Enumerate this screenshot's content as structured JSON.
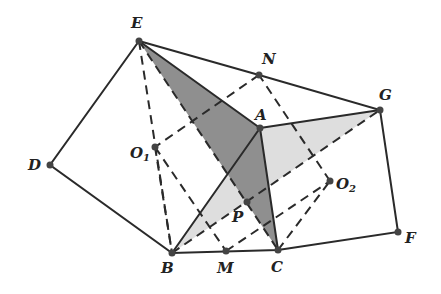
{
  "diagram": {
    "type": "geometry",
    "colors": {
      "dark_fill": "#8c8c8c",
      "light_fill": "#dcdcdc",
      "line": "#2a2a2a"
    },
    "points": {
      "E": {
        "label": "E",
        "x": 139,
        "y": 41
      },
      "N": {
        "label": "N",
        "x": 259,
        "y": 75
      },
      "G": {
        "label": "G",
        "x": 380,
        "y": 110
      },
      "A": {
        "label": "A",
        "x": 260,
        "y": 128
      },
      "O1": {
        "label": "O",
        "sub": "1",
        "x": 155,
        "y": 147
      },
      "D": {
        "label": "D",
        "x": 50,
        "y": 165
      },
      "O2": {
        "label": "O",
        "sub": "2",
        "x": 330,
        "y": 181
      },
      "P": {
        "label": "P",
        "x": 247,
        "y": 202
      },
      "B": {
        "label": "B",
        "x": 172,
        "y": 253
      },
      "M": {
        "label": "M",
        "x": 226,
        "y": 251
      },
      "C": {
        "label": "C",
        "x": 278,
        "y": 250
      },
      "F": {
        "label": "F",
        "x": 398,
        "y": 232
      }
    },
    "shaded_regions": [
      {
        "name": "triangle-EAC",
        "vertices": [
          "E",
          "A",
          "C"
        ],
        "shade": "dark"
      },
      {
        "name": "triangle-BAG",
        "vertices": [
          "B",
          "A",
          "G"
        ],
        "shade": "light"
      }
    ],
    "solid_edges": [
      [
        "E",
        "D"
      ],
      [
        "D",
        "B"
      ],
      [
        "B",
        "C"
      ],
      [
        "C",
        "F"
      ],
      [
        "F",
        "G"
      ],
      [
        "G",
        "N"
      ],
      [
        "N",
        "E"
      ],
      [
        "E",
        "A"
      ],
      [
        "A",
        "G"
      ],
      [
        "A",
        "B"
      ],
      [
        "A",
        "C"
      ]
    ],
    "dashed_edges": [
      [
        "E",
        "B"
      ],
      [
        "E",
        "C"
      ],
      [
        "B",
        "G"
      ],
      [
        "C",
        "O2"
      ],
      [
        "O2",
        "N"
      ],
      [
        "N",
        "O1"
      ],
      [
        "O1",
        "M"
      ],
      [
        "M",
        "P"
      ],
      [
        "P",
        "A"
      ],
      [
        "B",
        "O1"
      ]
    ]
  }
}
